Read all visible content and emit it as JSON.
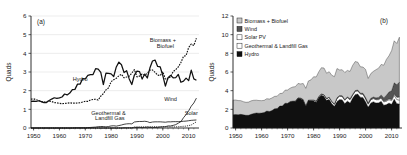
{
  "figure": {
    "panels": [
      {
        "tag": "(a)",
        "type": "line",
        "ylabel": "Quads",
        "xlabel": "",
        "ylim": [
          0,
          6
        ],
        "xlim": [
          1949,
          2014
        ],
        "yticks": [
          0,
          1,
          2,
          3,
          4,
          5,
          6
        ],
        "xticks": [
          1950,
          1960,
          1970,
          1980,
          1990,
          2000,
          2010
        ],
        "annotations": [
          {
            "name": "hydro",
            "text": "Hydro",
            "x": 1968,
            "y": 2.52
          },
          {
            "name": "biomass-biofuel-line1",
            "text": "Biomass +",
            "x": 2000,
            "y": 4.62
          },
          {
            "name": "biomass-biofuel-line2",
            "text": "Biofuel",
            "x": 2001,
            "y": 4.26
          },
          {
            "name": "geothermal-landfill-line1",
            "text": "Geothermal &",
            "x": 1979,
            "y": 0.72
          },
          {
            "name": "geothermal-landfill-line2",
            "text": "Landfill Gas",
            "x": 1979.5,
            "y": 0.42
          },
          {
            "name": "wind",
            "text": "Wind",
            "x": 2003,
            "y": 1.42
          },
          {
            "name": "solar",
            "text": "Solar",
            "x": 2011,
            "y": 0.72
          }
        ]
      },
      {
        "tag": "(b)",
        "type": "area",
        "ylabel": "Quads",
        "xlabel": "",
        "ylim": [
          0,
          12
        ],
        "xlim": [
          1949,
          2014
        ],
        "yticks": [
          0,
          2,
          4,
          6,
          8,
          10,
          12
        ],
        "xticks": [
          1950,
          1960,
          1970,
          1980,
          1990,
          2000,
          2010
        ],
        "legend": [
          {
            "label": "Biomass + Biofuel",
            "swatch": "#c8c8c8"
          },
          {
            "label": "Wind",
            "swatch": "#545454"
          },
          {
            "label": "Solar PV",
            "swatch": "#ffffff"
          },
          {
            "label": "Geothermal & Landfill Gas",
            "swatch": "#ffffff"
          },
          {
            "label": "Hydro",
            "swatch": "#101010"
          }
        ]
      }
    ]
  },
  "chart_data": [
    {
      "type": "line",
      "title": "",
      "panel": "(a)",
      "xlabel": "",
      "ylabel": "Quads",
      "xlim": [
        1949,
        2014
      ],
      "ylim": [
        0,
        6
      ],
      "grid": true,
      "legend_position": "inline-annotations",
      "x": [
        1949,
        1950,
        1951,
        1952,
        1953,
        1954,
        1955,
        1956,
        1957,
        1958,
        1959,
        1960,
        1961,
        1962,
        1963,
        1964,
        1965,
        1966,
        1967,
        1968,
        1969,
        1970,
        1971,
        1972,
        1973,
        1974,
        1975,
        1976,
        1977,
        1978,
        1979,
        1980,
        1981,
        1982,
        1983,
        1984,
        1985,
        1986,
        1987,
        1988,
        1989,
        1990,
        1991,
        1992,
        1993,
        1994,
        1995,
        1996,
        1997,
        1998,
        1999,
        2000,
        2001,
        2002,
        2003,
        2004,
        2005,
        2006,
        2007,
        2008,
        2009,
        2010,
        2011,
        2012,
        2013
      ],
      "series": [
        {
          "name": "Hydro",
          "style": "solid",
          "values": [
            1.43,
            1.44,
            1.42,
            1.46,
            1.41,
            1.36,
            1.36,
            1.47,
            1.55,
            1.62,
            1.59,
            1.61,
            1.66,
            1.82,
            1.77,
            1.87,
            2.06,
            2.07,
            2.35,
            2.35,
            2.65,
            2.63,
            2.82,
            2.86,
            2.86,
            3.18,
            3.15,
            2.98,
            2.33,
            2.94,
            2.93,
            2.9,
            2.76,
            3.27,
            3.53,
            3.39,
            2.97,
            3.07,
            2.63,
            2.33,
            2.84,
            3.05,
            3.02,
            2.62,
            2.89,
            2.68,
            3.21,
            3.59,
            3.64,
            3.3,
            3.27,
            2.81,
            2.24,
            2.69,
            2.82,
            2.69,
            2.7,
            2.87,
            2.45,
            2.51,
            2.67,
            2.54,
            3.1,
            2.63,
            2.56
          ]
        },
        {
          "name": "Biomass + Biofuel",
          "style": "dashed",
          "values": [
            1.55,
            1.56,
            1.52,
            1.47,
            1.41,
            1.39,
            1.42,
            1.44,
            1.42,
            1.36,
            1.35,
            1.32,
            1.3,
            1.32,
            1.33,
            1.35,
            1.33,
            1.33,
            1.34,
            1.35,
            1.39,
            1.43,
            1.43,
            1.5,
            1.53,
            1.54,
            1.5,
            1.71,
            1.84,
            2.04,
            2.15,
            2.48,
            2.59,
            2.66,
            2.8,
            2.88,
            2.69,
            2.73,
            2.78,
            2.94,
            3.13,
            2.74,
            2.78,
            2.89,
            2.83,
            2.93,
            3.1,
            3.11,
            2.98,
            2.83,
            2.81,
            3.01,
            2.62,
            2.64,
            2.75,
            3.02,
            3.13,
            3.27,
            3.51,
            3.84,
            3.88,
            4.31,
            4.5,
            4.42,
            4.81
          ]
        },
        {
          "name": "Geothermal & Landfill Gas",
          "style": "solid-thin",
          "values": [
            0.0,
            0.0,
            0.0,
            0.0,
            0.0,
            0.0,
            0.0,
            0.0,
            0.0,
            0.0,
            0.0,
            0.0,
            0.0,
            0.0,
            0.0,
            0.0,
            0.0,
            0.01,
            0.01,
            0.01,
            0.01,
            0.01,
            0.02,
            0.03,
            0.04,
            0.05,
            0.07,
            0.08,
            0.08,
            0.06,
            0.08,
            0.11,
            0.12,
            0.1,
            0.13,
            0.16,
            0.2,
            0.22,
            0.23,
            0.22,
            0.32,
            0.34,
            0.35,
            0.35,
            0.36,
            0.34,
            0.29,
            0.32,
            0.33,
            0.33,
            0.33,
            0.32,
            0.31,
            0.33,
            0.33,
            0.34,
            0.34,
            0.34,
            0.35,
            0.36,
            0.37,
            0.39,
            0.41,
            0.42,
            0.43
          ]
        },
        {
          "name": "Wind",
          "style": "solid-thin",
          "values": [
            0.0,
            0.0,
            0.0,
            0.0,
            0.0,
            0.0,
            0.0,
            0.0,
            0.0,
            0.0,
            0.0,
            0.0,
            0.0,
            0.0,
            0.0,
            0.0,
            0.0,
            0.0,
            0.0,
            0.0,
            0.0,
            0.0,
            0.0,
            0.0,
            0.0,
            0.0,
            0.0,
            0.0,
            0.0,
            0.0,
            0.0,
            0.0,
            0.0,
            0.0,
            0.0,
            0.0,
            0.01,
            0.01,
            0.01,
            0.01,
            0.02,
            0.03,
            0.03,
            0.03,
            0.03,
            0.04,
            0.03,
            0.03,
            0.03,
            0.03,
            0.05,
            0.06,
            0.07,
            0.11,
            0.11,
            0.14,
            0.18,
            0.26,
            0.34,
            0.55,
            0.72,
            0.92,
            1.17,
            1.34,
            1.6
          ]
        },
        {
          "name": "Solar",
          "style": "dashed-thin",
          "values": [
            0.0,
            0.0,
            0.0,
            0.0,
            0.0,
            0.0,
            0.0,
            0.0,
            0.0,
            0.0,
            0.0,
            0.0,
            0.0,
            0.0,
            0.0,
            0.0,
            0.0,
            0.0,
            0.0,
            0.0,
            0.0,
            0.0,
            0.0,
            0.0,
            0.0,
            0.0,
            0.0,
            0.0,
            0.0,
            0.0,
            0.0,
            0.0,
            0.0,
            0.0,
            0.0,
            0.0,
            0.0,
            0.0,
            0.0,
            0.0,
            0.06,
            0.06,
            0.06,
            0.06,
            0.06,
            0.07,
            0.07,
            0.07,
            0.07,
            0.07,
            0.07,
            0.07,
            0.07,
            0.06,
            0.06,
            0.06,
            0.06,
            0.07,
            0.08,
            0.09,
            0.1,
            0.13,
            0.16,
            0.25,
            0.33
          ]
        }
      ]
    },
    {
      "type": "area",
      "title": "",
      "panel": "(b)",
      "xlabel": "",
      "ylabel": "Quads",
      "xlim": [
        1949,
        2014
      ],
      "ylim": [
        0,
        12
      ],
      "grid": false,
      "stacked": true,
      "legend_position": "upper-left",
      "x": [
        1949,
        1950,
        1951,
        1952,
        1953,
        1954,
        1955,
        1956,
        1957,
        1958,
        1959,
        1960,
        1961,
        1962,
        1963,
        1964,
        1965,
        1966,
        1967,
        1968,
        1969,
        1970,
        1971,
        1972,
        1973,
        1974,
        1975,
        1976,
        1977,
        1978,
        1979,
        1980,
        1981,
        1982,
        1983,
        1984,
        1985,
        1986,
        1987,
        1988,
        1989,
        1990,
        1991,
        1992,
        1993,
        1994,
        1995,
        1996,
        1997,
        1998,
        1999,
        2000,
        2001,
        2002,
        2003,
        2004,
        2005,
        2006,
        2007,
        2008,
        2009,
        2010,
        2011,
        2012,
        2013
      ],
      "series": [
        {
          "name": "Hydro",
          "color": "#101010",
          "values": [
            1.43,
            1.44,
            1.42,
            1.46,
            1.41,
            1.36,
            1.36,
            1.47,
            1.55,
            1.62,
            1.59,
            1.61,
            1.66,
            1.82,
            1.77,
            1.87,
            2.06,
            2.07,
            2.35,
            2.35,
            2.65,
            2.63,
            2.82,
            2.86,
            2.86,
            3.18,
            3.15,
            2.98,
            2.33,
            2.94,
            2.93,
            2.9,
            2.76,
            3.27,
            3.53,
            3.39,
            2.97,
            3.07,
            2.63,
            2.33,
            2.84,
            3.05,
            3.02,
            2.62,
            2.89,
            2.68,
            3.21,
            3.59,
            3.64,
            3.3,
            3.27,
            2.81,
            2.24,
            2.69,
            2.82,
            2.69,
            2.7,
            2.87,
            2.45,
            2.51,
            2.67,
            2.54,
            3.1,
            2.63,
            2.56
          ]
        },
        {
          "name": "Geothermal & Landfill Gas",
          "color": "#ffffff",
          "values": [
            0.0,
            0.0,
            0.0,
            0.0,
            0.0,
            0.0,
            0.0,
            0.0,
            0.0,
            0.0,
            0.0,
            0.0,
            0.0,
            0.0,
            0.0,
            0.0,
            0.0,
            0.01,
            0.01,
            0.01,
            0.01,
            0.01,
            0.02,
            0.03,
            0.04,
            0.05,
            0.07,
            0.08,
            0.08,
            0.06,
            0.08,
            0.11,
            0.12,
            0.1,
            0.13,
            0.16,
            0.2,
            0.22,
            0.23,
            0.22,
            0.32,
            0.34,
            0.35,
            0.35,
            0.36,
            0.34,
            0.29,
            0.32,
            0.33,
            0.33,
            0.33,
            0.32,
            0.31,
            0.33,
            0.33,
            0.34,
            0.34,
            0.34,
            0.35,
            0.36,
            0.37,
            0.39,
            0.41,
            0.42,
            0.43
          ]
        },
        {
          "name": "Solar PV",
          "color": "#ffffff",
          "values": [
            0.0,
            0.0,
            0.0,
            0.0,
            0.0,
            0.0,
            0.0,
            0.0,
            0.0,
            0.0,
            0.0,
            0.0,
            0.0,
            0.0,
            0.0,
            0.0,
            0.0,
            0.0,
            0.0,
            0.0,
            0.0,
            0.0,
            0.0,
            0.0,
            0.0,
            0.0,
            0.0,
            0.0,
            0.0,
            0.0,
            0.0,
            0.0,
            0.0,
            0.0,
            0.0,
            0.0,
            0.0,
            0.0,
            0.0,
            0.0,
            0.06,
            0.06,
            0.06,
            0.06,
            0.06,
            0.07,
            0.07,
            0.07,
            0.07,
            0.07,
            0.07,
            0.07,
            0.07,
            0.06,
            0.06,
            0.06,
            0.06,
            0.07,
            0.08,
            0.09,
            0.1,
            0.13,
            0.16,
            0.25,
            0.33
          ]
        },
        {
          "name": "Wind",
          "color": "#545454",
          "values": [
            0.0,
            0.0,
            0.0,
            0.0,
            0.0,
            0.0,
            0.0,
            0.0,
            0.0,
            0.0,
            0.0,
            0.0,
            0.0,
            0.0,
            0.0,
            0.0,
            0.0,
            0.0,
            0.0,
            0.0,
            0.0,
            0.0,
            0.0,
            0.0,
            0.0,
            0.0,
            0.0,
            0.0,
            0.0,
            0.0,
            0.0,
            0.0,
            0.0,
            0.0,
            0.0,
            0.0,
            0.01,
            0.01,
            0.01,
            0.01,
            0.02,
            0.03,
            0.03,
            0.03,
            0.03,
            0.04,
            0.03,
            0.03,
            0.03,
            0.03,
            0.05,
            0.06,
            0.07,
            0.11,
            0.11,
            0.14,
            0.18,
            0.26,
            0.34,
            0.55,
            0.72,
            0.92,
            1.17,
            1.34,
            1.6
          ]
        },
        {
          "name": "Biomass + Biofuel",
          "color": "#c8c8c8",
          "values": [
            1.55,
            1.56,
            1.52,
            1.47,
            1.41,
            1.39,
            1.42,
            1.44,
            1.42,
            1.36,
            1.35,
            1.32,
            1.3,
            1.32,
            1.33,
            1.35,
            1.33,
            1.33,
            1.34,
            1.35,
            1.39,
            1.43,
            1.43,
            1.5,
            1.53,
            1.54,
            1.5,
            1.71,
            1.84,
            2.04,
            2.15,
            2.48,
            2.59,
            2.66,
            2.8,
            2.88,
            2.69,
            2.73,
            2.78,
            2.94,
            3.13,
            2.74,
            2.78,
            2.89,
            2.83,
            2.93,
            3.1,
            3.11,
            2.98,
            2.83,
            2.81,
            3.01,
            2.62,
            2.64,
            2.75,
            3.02,
            3.13,
            3.27,
            3.51,
            3.84,
            3.88,
            4.31,
            4.5,
            4.42,
            4.81
          ]
        }
      ]
    }
  ]
}
